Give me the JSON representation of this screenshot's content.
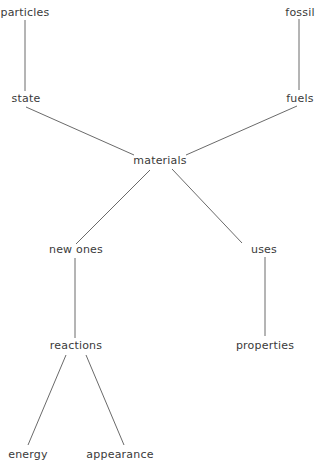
{
  "diagram": {
    "type": "concept-map",
    "central_node": "materials",
    "nodes": [
      {
        "id": "particles",
        "label": "particles",
        "x": 25,
        "y": 13
      },
      {
        "id": "fossil",
        "label": "fossil",
        "x": 300,
        "y": 13
      },
      {
        "id": "state",
        "label": "state",
        "x": 26,
        "y": 99
      },
      {
        "id": "fuels",
        "label": "fuels",
        "x": 300,
        "y": 99
      },
      {
        "id": "materials",
        "label": "materials",
        "x": 160,
        "y": 161
      },
      {
        "id": "new_ones",
        "label": "new ones",
        "x": 76,
        "y": 250
      },
      {
        "id": "uses",
        "label": "uses",
        "x": 264,
        "y": 250
      },
      {
        "id": "reactions",
        "label": "reactions",
        "x": 76,
        "y": 346
      },
      {
        "id": "properties",
        "label": "properties",
        "x": 265,
        "y": 346
      },
      {
        "id": "energy",
        "label": "energy",
        "x": 28,
        "y": 455
      },
      {
        "id": "appearance",
        "label": "appearance",
        "x": 120,
        "y": 455
      }
    ],
    "edges": [
      {
        "from": "particles",
        "to": "state",
        "x1": 25,
        "y1": 20,
        "x2": 25,
        "y2": 91
      },
      {
        "from": "fossil",
        "to": "fuels",
        "x1": 299,
        "y1": 19,
        "x2": 299,
        "y2": 90
      },
      {
        "from": "state",
        "to": "materials",
        "x1": 26,
        "y1": 107,
        "x2": 134,
        "y2": 155
      },
      {
        "from": "fuels",
        "to": "materials",
        "x1": 297,
        "y1": 106,
        "x2": 186,
        "y2": 155
      },
      {
        "from": "materials",
        "to": "new_ones",
        "x1": 150,
        "y1": 170,
        "x2": 76,
        "y2": 244
      },
      {
        "from": "materials",
        "to": "uses",
        "x1": 172,
        "y1": 169,
        "x2": 242,
        "y2": 243
      },
      {
        "from": "new_ones",
        "to": "reactions",
        "x1": 75,
        "y1": 258,
        "x2": 75,
        "y2": 338
      },
      {
        "from": "uses",
        "to": "properties",
        "x1": 265,
        "y1": 257,
        "x2": 265,
        "y2": 336
      },
      {
        "from": "reactions",
        "to": "energy",
        "x1": 66,
        "y1": 355,
        "x2": 28,
        "y2": 445
      },
      {
        "from": "reactions",
        "to": "appearance",
        "x1": 86,
        "y1": 355,
        "x2": 124,
        "y2": 445
      }
    ]
  },
  "colors": {
    "background": "#ffffff",
    "text": "#3a3a3a",
    "line": "#6a6a6a"
  }
}
